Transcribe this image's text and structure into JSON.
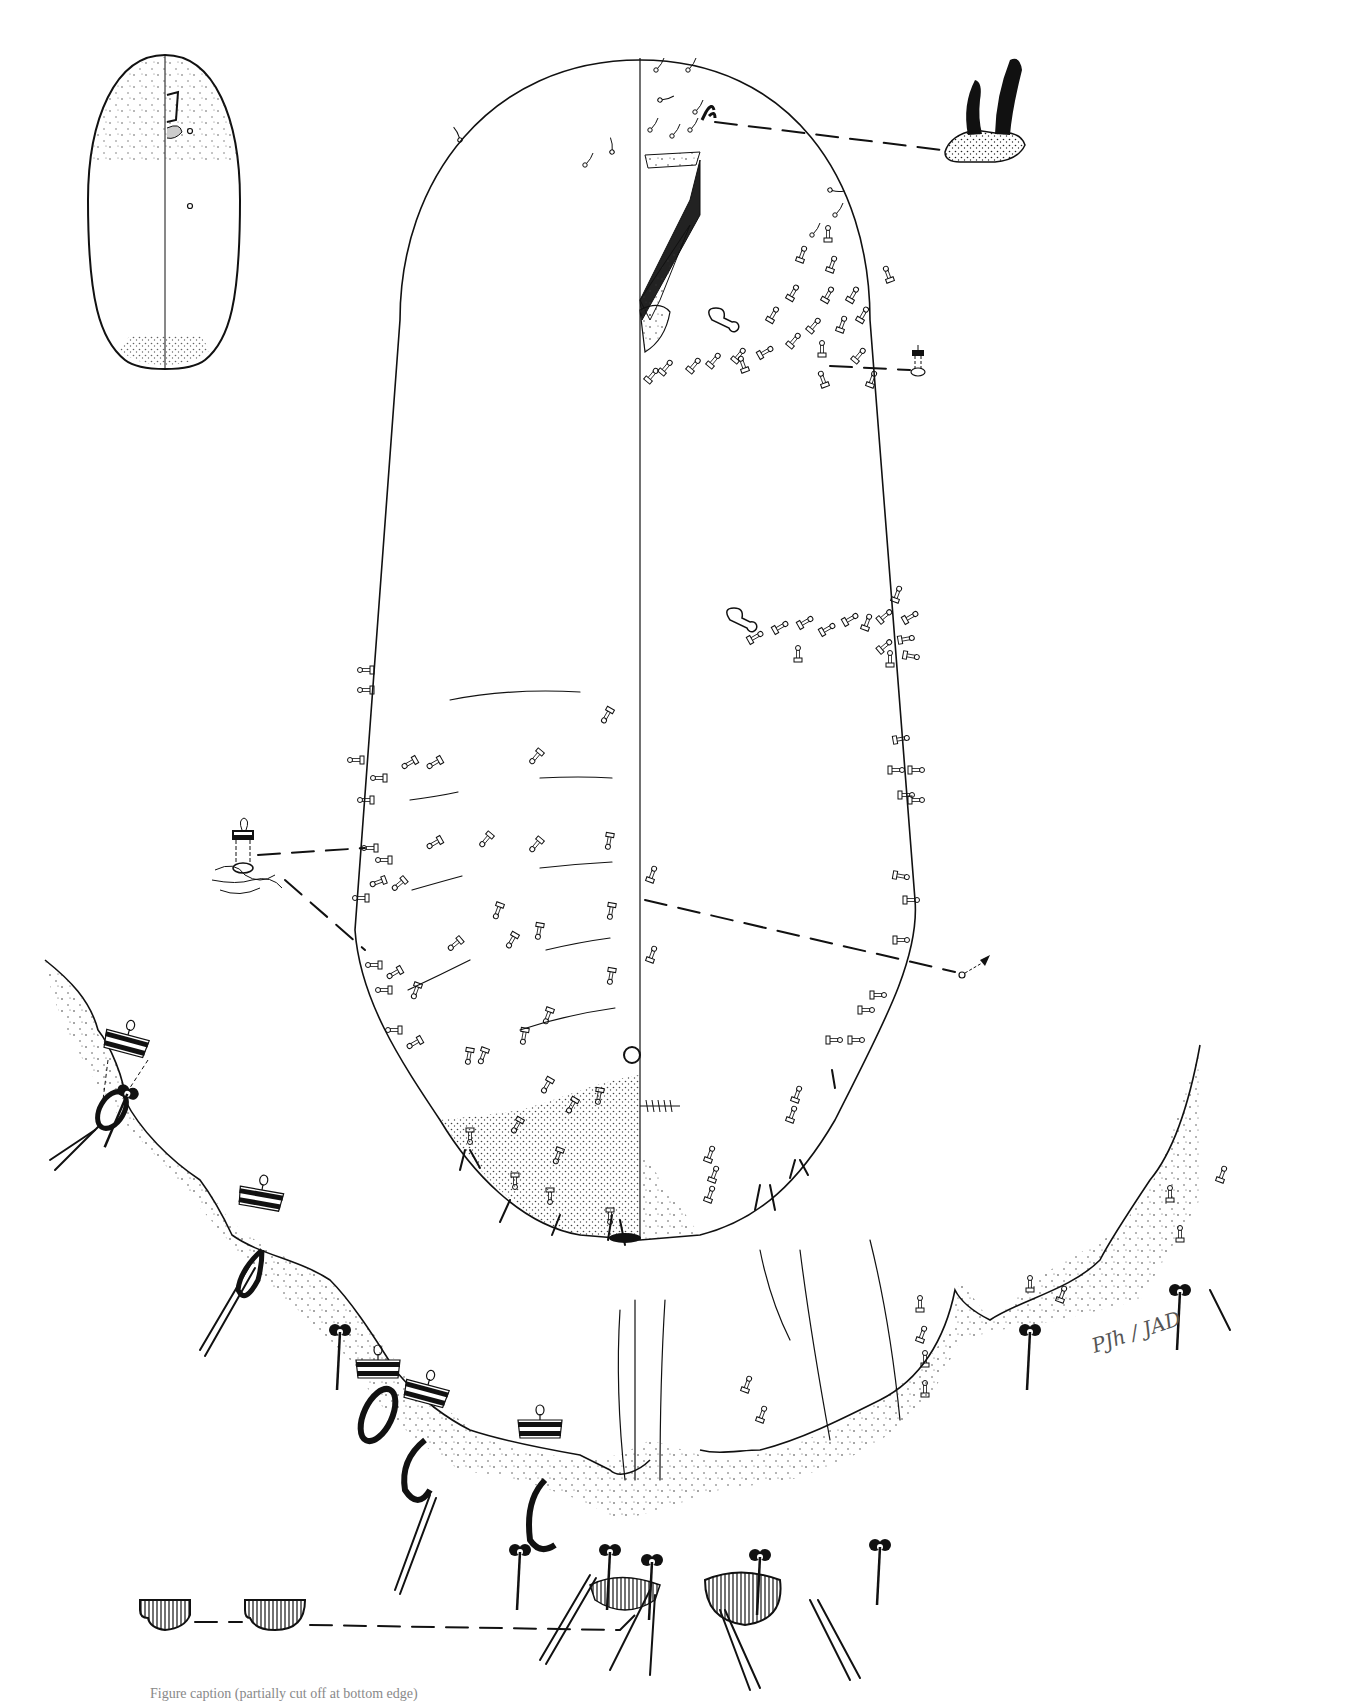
{
  "figure": {
    "type": "taxonomic illustration",
    "views": {
      "main_body": "dorsum (left half) / venter (right half) split along midline",
      "inset_top_left": "whole-body habitus outline",
      "detail_top_right": "enlarged antenna-like paired setae on tubercle",
      "detail_left_middle": "enlarged tubular duct",
      "detail_right_middle": "enlarged duct",
      "detail_right_lower": "enlarged spine",
      "bottom_enlargement": "enlarged posterior abdominal margin with ducts, setae and anal lobes",
      "bottom_left_detail": "anal plate / lobe shapes"
    },
    "signature": "PJh / JAD",
    "caption_visible": "Figure caption (partially cut off at bottom edge)"
  },
  "colors": {
    "ink": "#111111",
    "paper": "#ffffff",
    "stipple": "#333333"
  }
}
